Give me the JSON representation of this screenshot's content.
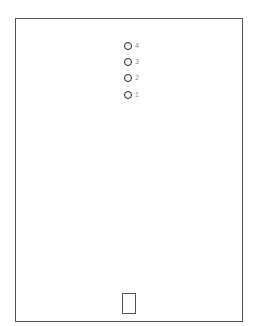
{
  "diagram": {
    "frame": {
      "stroke": "#555555"
    },
    "markers": [
      {
        "label": "4",
        "top": 41
      },
      {
        "label": "3",
        "top": 57
      },
      {
        "label": "2",
        "top": 73
      },
      {
        "label": "1",
        "top": 90
      }
    ],
    "bottom_box": {
      "label": ""
    }
  }
}
